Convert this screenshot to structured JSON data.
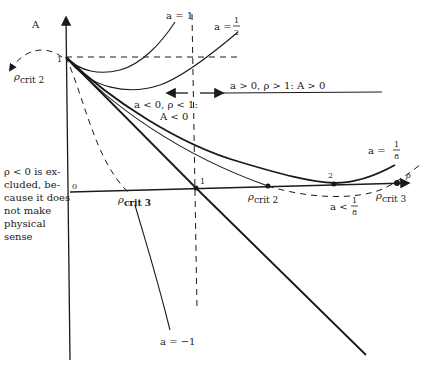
{
  "axes": {
    "y_label": "A",
    "x_label": "ρ",
    "origin_label": "0",
    "y_tick_1": "1",
    "x_tick_1": "1",
    "x_tick_2": "2"
  },
  "curves": {
    "a_eq_1": "a = 1",
    "a_eq_half_prefix": "a =",
    "a_eq_half_num": "1",
    "a_eq_half_den": "2",
    "a_eq_eighth_prefix": "a =",
    "a_eq_eighth_num": "1",
    "a_eq_eighth_den": "8",
    "a_lt_eighth_prefix": "a <",
    "a_lt_eighth_num": "1",
    "a_lt_eighth_den": "8",
    "a_eq_neg1": "a = −1"
  },
  "critical_points": {
    "rho_sym": "ρ",
    "crit2_sub": "crit 2",
    "crit3_sub": "crit 3"
  },
  "regions": {
    "neg_region_line1": "a < 0, ρ < 1:",
    "neg_region_line2": "A < 0",
    "pos_region": "a > 0,  ρ > 1: A > 0"
  },
  "side_note": {
    "lines": [
      "ρ < 0 is ex-",
      "cluded, be-",
      "cause it does",
      "not make",
      "physical",
      "sense"
    ]
  },
  "colors": {
    "ink": "#1a1a1a",
    "background": "#ffffff"
  }
}
